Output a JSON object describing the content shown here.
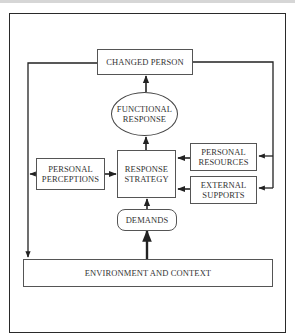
{
  "diagram": {
    "type": "flowchart",
    "title": "",
    "nodes": {
      "changed_person": "CHANGED PERSON",
      "functional_response": "FUNCTIONAL RESPONSE",
      "response_strategy": "RESPONSE STRATEGY",
      "personal_perceptions": "PERSONAL PERCEPTIONS",
      "personal_resources": "PERSONAL RESOURCES",
      "external_supports": "EXTERNAL SUPPORTS",
      "demands": "DEMANDS",
      "environment_context": "ENVIRONMENT AND CONTEXT"
    },
    "lines": {
      "functional_response_1": "FUNCTIONAL",
      "functional_response_2": "RESPONSE",
      "response_strategy_1": "RESPONSE",
      "response_strategy_2": "STRATEGY",
      "personal_perceptions_1": "PERSONAL",
      "personal_perceptions_2": "PERCEPTIONS",
      "personal_resources_1": "PERSONAL",
      "personal_resources_2": "RESOURCES",
      "external_supports_1": "EXTERNAL",
      "external_supports_2": "SUPPORTS"
    },
    "edges": [
      {
        "from": "ENVIRONMENT AND CONTEXT",
        "to": "DEMANDS"
      },
      {
        "from": "DEMANDS",
        "to": "RESPONSE STRATEGY"
      },
      {
        "from": "PERSONAL PERCEPTIONS",
        "to": "RESPONSE STRATEGY"
      },
      {
        "from": "PERSONAL RESOURCES",
        "to": "RESPONSE STRATEGY"
      },
      {
        "from": "EXTERNAL SUPPORTS",
        "to": "RESPONSE STRATEGY"
      },
      {
        "from": "RESPONSE STRATEGY",
        "to": "FUNCTIONAL RESPONSE"
      },
      {
        "from": "FUNCTIONAL RESPONSE",
        "to": "CHANGED PERSON"
      },
      {
        "from": "CHANGED PERSON",
        "to": "PERSONAL RESOURCES"
      },
      {
        "from": "CHANGED PERSON",
        "to": "EXTERNAL SUPPORTS"
      },
      {
        "from": "CHANGED PERSON",
        "to": "ENVIRONMENT AND CONTEXT"
      },
      {
        "from": "PERSONAL PERCEPTIONS",
        "to": "ENVIRONMENT AND CONTEXT (left loop)"
      }
    ],
    "colors": {
      "line": "#222222",
      "box_border": "#555555",
      "text": "#333333",
      "top_band": "#d6d6d6"
    }
  }
}
